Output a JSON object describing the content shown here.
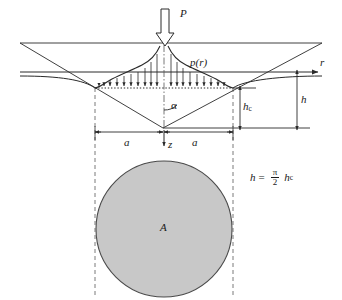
{
  "figure": {
    "labels": {
      "load": "P",
      "pressure_function": "p(r)",
      "radial_axis": "r",
      "depth_axis": "z",
      "cone_half_angle": "α",
      "contact_depth": "h",
      "contact_depth_sub": "c",
      "total_depth": "h",
      "contact_radius_left": "a",
      "contact_radius_right": "a",
      "contact_area": "A"
    },
    "formula": {
      "lhs": "h",
      "equals": "=",
      "numerator": "π",
      "denominator": "2",
      "rhs": "h",
      "rhs_sub": "c",
      "full_text": "h = (π/2) h_c"
    },
    "geometry": {
      "surface_line_y": 43,
      "r_axis_y": 72,
      "contact_line_y": 88,
      "apex_y": 128,
      "apex_x": 163,
      "contact_left_x": 95,
      "contact_right_x": 233,
      "circle_center_x": 164,
      "circle_center_y": 229,
      "circle_radius": 68,
      "pressure_arrow_count": 19,
      "dimension_a_y": 132,
      "hc_dim_x": 240,
      "h_dim_x": 297
    },
    "colors": {
      "line": "#2a2a2a",
      "area_fill": "#c8c8c8",
      "area_stroke": "#555555",
      "dashed": "#6b6b6b",
      "background": "#ffffff"
    }
  }
}
